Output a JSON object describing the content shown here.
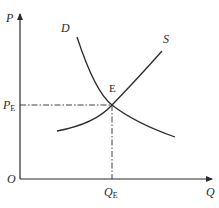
{
  "diagram": {
    "type": "supply-demand",
    "axes": {
      "y_label": "P",
      "x_label": "Q",
      "origin_label": "O"
    },
    "curves": {
      "demand_label": "D",
      "supply_label": "S"
    },
    "equilibrium": {
      "point_label": "E",
      "price_label_main": "P",
      "price_label_sub": "E",
      "quantity_label_main": "Q",
      "quantity_label_sub": "E"
    },
    "colors": {
      "line": "#2a2a2a",
      "background": "#ffffff"
    }
  }
}
